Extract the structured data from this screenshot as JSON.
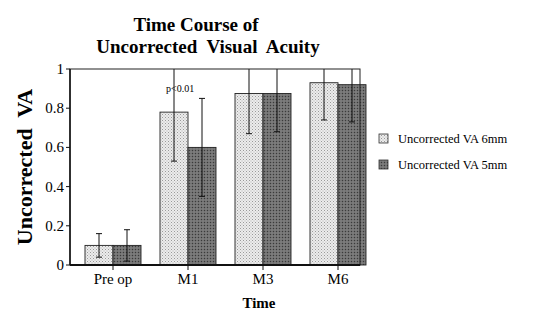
{
  "chart_data": {
    "type": "bar",
    "title": "Time Course of Uncorrected Visual Acuity",
    "title_lines": [
      "Time Course of",
      "Uncorrected  Visual  Acuity"
    ],
    "xlabel": "Time",
    "ylabel": "Uncorrected  VA",
    "categories": [
      "Pre op",
      "M1",
      "M3",
      "M6"
    ],
    "ylim": [
      0,
      1
    ],
    "yticks": [
      0,
      0.2,
      0.4,
      0.6,
      0.8,
      1
    ],
    "ytick_labels": [
      "0",
      "0.2",
      "0.4",
      "0.6",
      "0.8",
      "1"
    ],
    "grid": false,
    "legend_position": "right",
    "series": [
      {
        "name": "Uncorrected VA 6mm",
        "values": [
          0.1,
          0.78,
          0.875,
          0.93
        ],
        "error_low": [
          0.04,
          0.53,
          0.67,
          0.74
        ],
        "error_high": [
          0.16,
          1.0,
          1.0,
          1.0
        ],
        "color": "#e4e4e4",
        "pattern": "light-dots"
      },
      {
        "name": "Uncorrected VA 5mm",
        "values": [
          0.1,
          0.6,
          0.875,
          0.92
        ],
        "error_low": [
          0.02,
          0.35,
          0.68,
          0.73
        ],
        "error_high": [
          0.18,
          0.85,
          1.0,
          1.0
        ],
        "color": "#6e6e6e",
        "pattern": "dark-dots"
      }
    ],
    "annotations": [
      {
        "text": "p<0.01",
        "category": "M1"
      }
    ]
  }
}
